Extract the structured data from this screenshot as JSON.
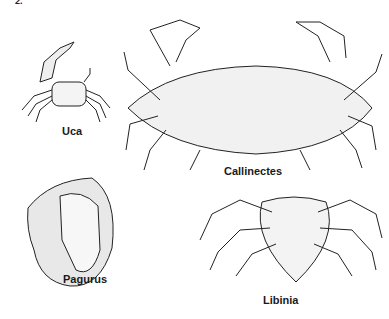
{
  "figure": {
    "number_fragment": "2.",
    "specimens": [
      {
        "name": "Uca",
        "label": "Uca"
      },
      {
        "name": "Callinectes",
        "label": "Callinectes"
      },
      {
        "name": "Pagurus",
        "label": "Pagurus"
      },
      {
        "name": "Libinia",
        "label": "Libinia"
      }
    ]
  }
}
